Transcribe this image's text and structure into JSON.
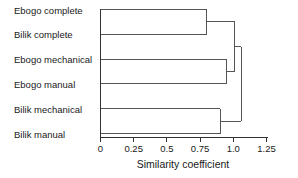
{
  "chart_data": {
    "type": "dendrogram",
    "title": "",
    "xlabel": "Similarity coefficient",
    "ylabel": "",
    "xlim": [
      0,
      1.25
    ],
    "xticks": [
      0,
      0.25,
      0.5,
      0.75,
      1.0,
      1.25
    ],
    "xticklabels": [
      "0",
      "0.25",
      "0.5",
      "0.75",
      "1.0",
      "1.25"
    ],
    "grid": false,
    "legend": null,
    "leaves": [
      "Ebogo complete",
      "Bilik complete",
      "Ebogo mechanical",
      "Ebogo manual",
      "Bilik mechanical",
      "Bilik manual"
    ],
    "merges": [
      {
        "id": "m1",
        "label": "Ebogo complete + Bilik complete",
        "members": [
          "Ebogo complete",
          "Bilik complete"
        ],
        "similarity": 0.8
      },
      {
        "id": "m2",
        "label": "Bilik mechanical + Bilik manual",
        "members": [
          "Bilik mechanical",
          "Bilik manual"
        ],
        "similarity": 0.9
      },
      {
        "id": "m3",
        "label": "Ebogo mechanical + Ebogo manual",
        "members": [
          "Ebogo mechanical",
          "Ebogo manual"
        ],
        "similarity": 0.95
      },
      {
        "id": "m4",
        "label": "complete cluster + Ebogo cluster",
        "members": [
          "m1",
          "m3"
        ],
        "similarity": 1.01
      },
      {
        "id": "m5",
        "label": "root",
        "members": [
          "m4",
          "m2"
        ],
        "similarity": 1.06
      }
    ],
    "line_color": "#555555",
    "axis_color": "#333333",
    "background_color": "#ffffff"
  },
  "axis": {
    "title": "Similarity coefficient"
  }
}
